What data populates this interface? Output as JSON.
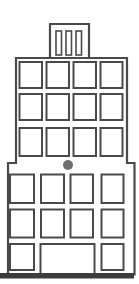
{
  "illustration": {
    "title": "office-building-line-drawing",
    "colors": {
      "background": "#ffffff",
      "outline": "#4a4a4a",
      "dot": "#6e6e6e",
      "ground": "#3c3c3c"
    },
    "rooftop": {
      "description": "small rooftop penthouse with vertical slot windows",
      "slot_count": 3
    },
    "upper_tower": {
      "description": "narrow upper tower section",
      "window_rows": 3,
      "window_columns": 4,
      "window_count": 12
    },
    "lower_base": {
      "description": "wider base section stepped out on both sides",
      "window_rows": 3,
      "window_columns": 4,
      "window_count": 8,
      "has_entrance_door": true
    },
    "accent_dot": {
      "shape": "circle",
      "position": "centered between tower and base"
    },
    "ground": {
      "shape": "thick horizontal bar"
    }
  }
}
